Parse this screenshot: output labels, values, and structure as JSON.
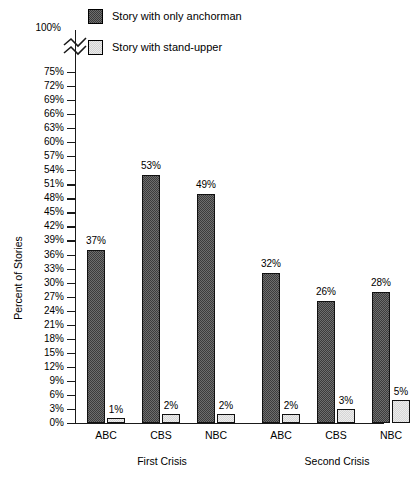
{
  "chart_data": {
    "type": "bar",
    "title": "",
    "xlabel": "",
    "ylabel": "Percent of Stories",
    "ylim": [
      0,
      100
    ],
    "y_tick_step": 3,
    "y_axis_break": true,
    "y_axis_break_note": "axis break between 75% and 100%",
    "grid": false,
    "legend_position": "top",
    "categories": [
      "ABC",
      "CBS",
      "NBC",
      "ABC",
      "CBS",
      "NBC"
    ],
    "groups": [
      {
        "label": "First Crisis",
        "categories": [
          "ABC",
          "CBS",
          "NBC"
        ]
      },
      {
        "label": "Second Crisis",
        "categories": [
          "ABC",
          "CBS",
          "NBC"
        ]
      }
    ],
    "series": [
      {
        "name": "Story with only anchorman",
        "values": [
          37,
          53,
          49,
          32,
          26,
          28
        ],
        "value_labels": [
          "37%",
          "53%",
          "49%",
          "32%",
          "26%",
          "28%"
        ],
        "color": "#555555"
      },
      {
        "name": "Story with stand-upper",
        "values": [
          1,
          2,
          2,
          2,
          3,
          5
        ],
        "value_labels": [
          "1%",
          "2%",
          "2%",
          "2%",
          "3%",
          "5%"
        ],
        "color": "#ececec"
      }
    ],
    "y_ticks": [
      {
        "value": 100,
        "label": "100%"
      },
      {
        "value": 75,
        "label": "75%"
      },
      {
        "value": 72,
        "label": "72%"
      },
      {
        "value": 69,
        "label": "69%"
      },
      {
        "value": 66,
        "label": "66%"
      },
      {
        "value": 63,
        "label": "63%"
      },
      {
        "value": 60,
        "label": "60%"
      },
      {
        "value": 57,
        "label": "57%"
      },
      {
        "value": 54,
        "label": "54%"
      },
      {
        "value": 51,
        "label": "51%"
      },
      {
        "value": 48,
        "label": "48%"
      },
      {
        "value": 45,
        "label": "45%"
      },
      {
        "value": 42,
        "label": "42%"
      },
      {
        "value": 39,
        "label": "39%"
      },
      {
        "value": 36,
        "label": "36%"
      },
      {
        "value": 33,
        "label": "33%"
      },
      {
        "value": 30,
        "label": "30%"
      },
      {
        "value": 27,
        "label": "27%"
      },
      {
        "value": 24,
        "label": "24%"
      },
      {
        "value": 21,
        "label": "21%"
      },
      {
        "value": 18,
        "label": "18%"
      },
      {
        "value": 15,
        "label": "15%"
      },
      {
        "value": 12,
        "label": "12%"
      },
      {
        "value": 9,
        "label": "9%"
      },
      {
        "value": 6,
        "label": "6%"
      },
      {
        "value": 3,
        "label": "3%"
      },
      {
        "value": 0,
        "label": "0%"
      }
    ]
  },
  "legend": {
    "items": [
      {
        "label": "Story with only anchorman",
        "swatch": "dark-checker-swatch"
      },
      {
        "label": "Story with stand-upper",
        "swatch": "light-checker-swatch"
      }
    ]
  }
}
